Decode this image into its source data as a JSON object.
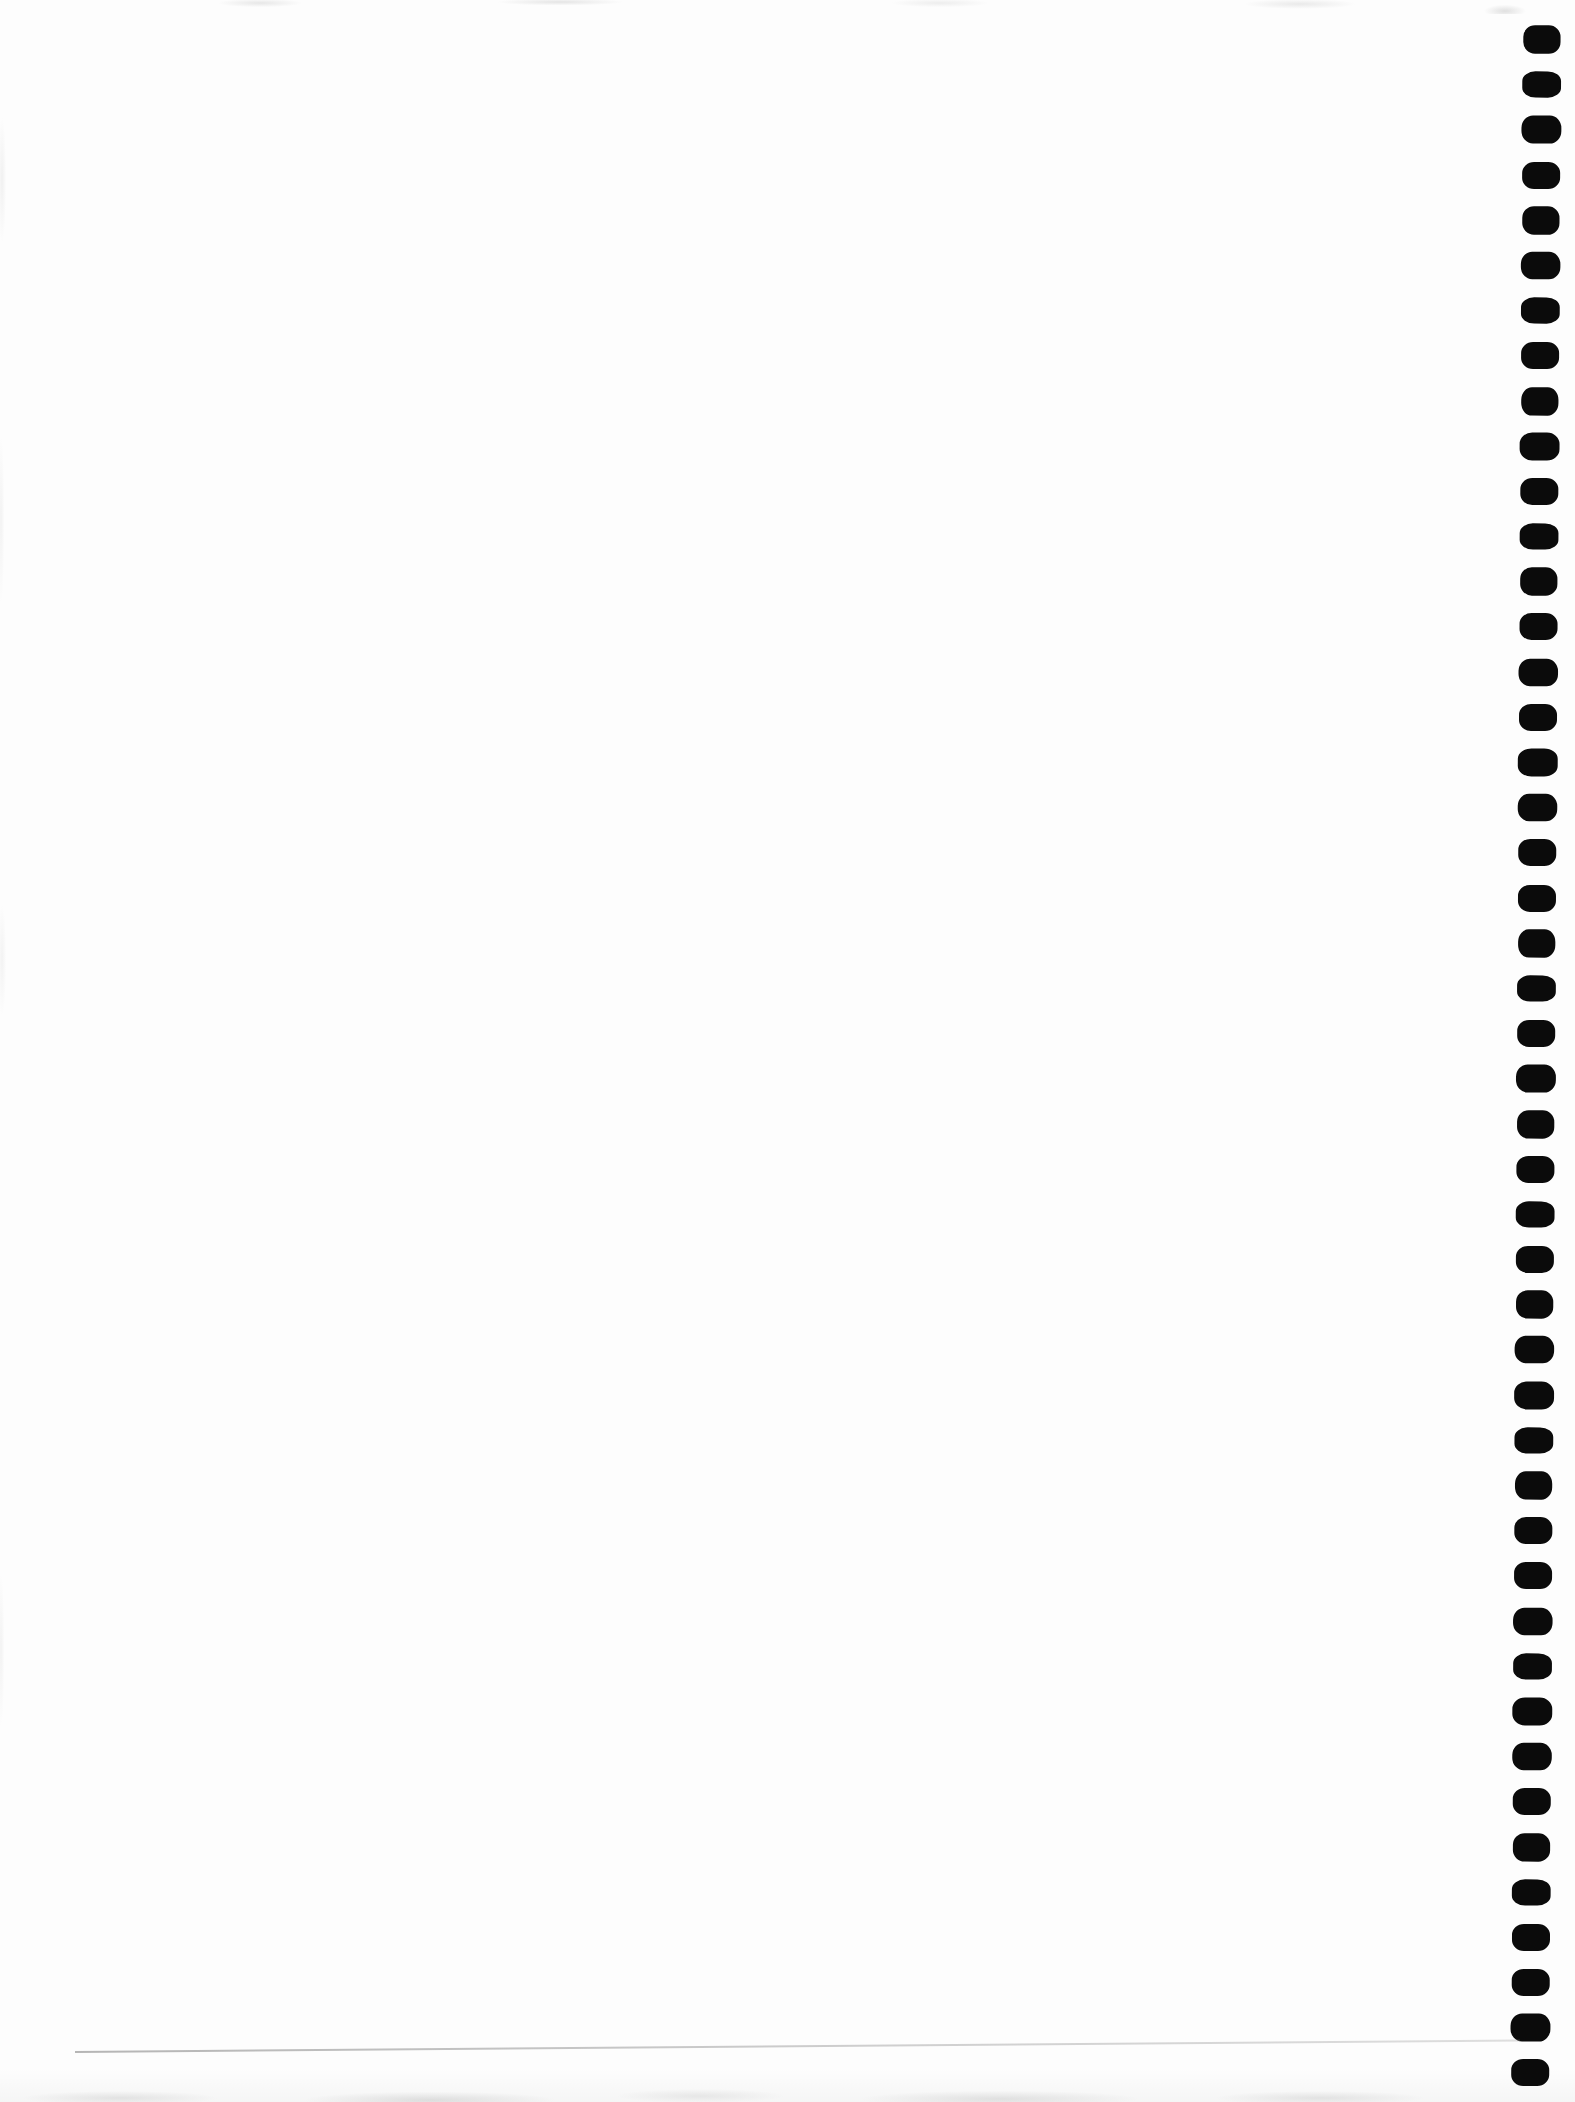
{
  "page": {
    "type": "scanned-blank-notebook-page",
    "content_text": "",
    "background_color": "#fdfdfd"
  },
  "binding": {
    "side": "right",
    "hole_count": 46,
    "hole_color": "#0b0b0b"
  },
  "artifacts": {
    "crease_line_color": "#8f8f8f",
    "scan_noise_color": "#d9d9d9"
  }
}
